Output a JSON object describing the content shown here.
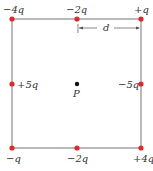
{
  "diagram": {
    "square": {
      "x1": 12,
      "y1": 19,
      "x2": 141,
      "y2": 148,
      "line_color": "#777777"
    },
    "charge_color": "#e02a2a",
    "point_color": "#111111",
    "charges": [
      {
        "label": "-4q",
        "x": 12,
        "y": 19,
        "lx": 3,
        "ly": 13
      },
      {
        "label": "-2q",
        "x": 77,
        "y": 19,
        "lx": 66,
        "ly": 13
      },
      {
        "label": "+q",
        "x": 141,
        "y": 19,
        "lx": 134,
        "ly": 13
      },
      {
        "label": "+5q",
        "x": 12,
        "y": 84,
        "lx": 17,
        "ly": 88
      },
      {
        "label": "-5q",
        "x": 141,
        "y": 84,
        "lx": 118,
        "ly": 88
      },
      {
        "label": "-q",
        "x": 12,
        "y": 148,
        "lx": 6,
        "ly": 162
      },
      {
        "label": "-2q",
        "x": 77,
        "y": 148,
        "lx": 67,
        "ly": 162
      },
      {
        "label": "+4q",
        "x": 141,
        "y": 148,
        "lx": 133,
        "ly": 162
      }
    ],
    "point": {
      "label": "P",
      "x": 77,
      "y": 84
    },
    "dimension": {
      "label": "d",
      "x1": 78,
      "x2": 140,
      "y": 28
    }
  }
}
